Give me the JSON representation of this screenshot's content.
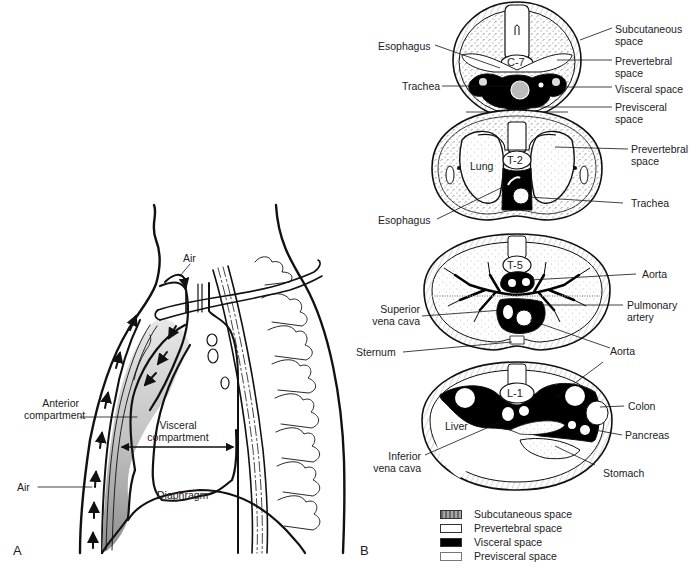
{
  "figure": {
    "panels": [
      {
        "id": "A",
        "letter": "A",
        "title": "Sagittal view of mediastinum",
        "labels": {
          "air_top": "Air",
          "anterior_compartment": "Anterior\ncompartment",
          "anterior_line1": "Anterior",
          "anterior_line2": "compartment",
          "visceral_line1": "Visceral",
          "visceral_line2": "compartment",
          "air_bottom": "Air",
          "diaphragm": "Diaphragm"
        }
      },
      {
        "id": "B",
        "letter": "B",
        "title": "Axial cross-sections",
        "sections": [
          {
            "level": "C-7",
            "left_labels": [
              "Esophagus",
              "Trachea"
            ],
            "right_labels": [
              {
                "line1": "Subcutaneous",
                "line2": "space"
              },
              {
                "line1": "Prevertebral",
                "line2": "space"
              },
              {
                "line1": "Visceral space",
                "line2": ""
              },
              {
                "line1": "Previsceral",
                "line2": "space"
              }
            ]
          },
          {
            "level": "T-2",
            "inner_labels": [
              "Lung"
            ],
            "left_labels": [
              "Esophagus"
            ],
            "right_labels": [
              {
                "line1": "Prevertebral",
                "line2": "space"
              },
              {
                "line1": "Trachea",
                "line2": ""
              }
            ]
          },
          {
            "level": "T-5",
            "left_labels": [
              {
                "line1": "Superior",
                "line2": "vena cava"
              },
              {
                "line1": "Sternum",
                "line2": ""
              }
            ],
            "right_labels": [
              {
                "line1": "Aorta",
                "line2": ""
              },
              {
                "line1": "Pulmonary",
                "line2": "artery"
              },
              {
                "line1": "Aorta",
                "line2": ""
              }
            ]
          },
          {
            "level": "L-1",
            "inner_labels": [
              "Liver"
            ],
            "left_labels": [
              {
                "line1": "Inferior",
                "line2": "vena cava"
              }
            ],
            "right_labels": [
              {
                "line1": "Colon",
                "line2": ""
              },
              {
                "line1": "Pancreas",
                "line2": ""
              },
              {
                "line1": "Stomach",
                "line2": ""
              }
            ]
          }
        ],
        "legend": [
          {
            "label": "Subcutaneous space",
            "fill": "#8a8a8a",
            "pattern": "stipple"
          },
          {
            "label": "Prevertebral space",
            "fill": "#ffffff",
            "pattern": "dotted"
          },
          {
            "label": "Visceral space",
            "fill": "#000000",
            "pattern": "solid"
          },
          {
            "label": "Previsceral space",
            "fill": "#ffffff",
            "pattern": "plain"
          }
        ]
      }
    ],
    "colors": {
      "line": "#111111",
      "anterior_fill": "#c8c8c8",
      "anterior_fill_dark": "#9a9a9a",
      "visceral_black": "#000000",
      "background": "#ffffff"
    }
  }
}
